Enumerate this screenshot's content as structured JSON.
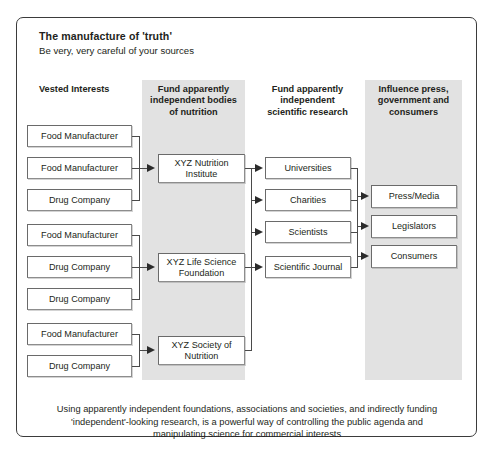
{
  "card": {
    "title": "The manufacture of 'truth'",
    "subtitle": "Be very, very careful of your sources"
  },
  "columns": [
    {
      "id": "vested-interests",
      "header": "Vested Interests",
      "shaded": false
    },
    {
      "id": "fund-bodies",
      "header": "Fund apparently independent bodies of nutrition",
      "shaded": true
    },
    {
      "id": "fund-research",
      "header": "Fund apparently independent scientific research",
      "shaded": false
    },
    {
      "id": "influence",
      "header": "Influence press, government and consumers",
      "shaded": true
    }
  ],
  "column_headers": {
    "c1": "Vested Interests",
    "c2_l1": "Fund apparently",
    "c2_l2": "independent bodies",
    "c2_l3": "of nutrition",
    "c3_l1": "Fund apparently",
    "c3_l2": "independent",
    "c3_l3": "scientific research",
    "c4_l1": "Influence press,",
    "c4_l2": "government and",
    "c4_l3": "consumers"
  },
  "vested_interests": [
    {
      "label": "Food Manufacturer",
      "group": 1
    },
    {
      "label": "Food Manufacturer",
      "group": 1
    },
    {
      "label": "Drug Company",
      "group": 1
    },
    {
      "label": "Food Manufacturer",
      "group": 2
    },
    {
      "label": "Drug Company",
      "group": 2
    },
    {
      "label": "Drug Company",
      "group": 2
    },
    {
      "label": "Food Manufacturer",
      "group": 3
    },
    {
      "label": "Drug Company",
      "group": 3
    }
  ],
  "bodies": [
    {
      "line1": "XYZ Nutrition",
      "line2": "Institute"
    },
    {
      "line1": "XYZ Life Science",
      "line2": "Foundation"
    },
    {
      "line1": "XYZ Society of",
      "line2": "Nutrition"
    }
  ],
  "research": [
    {
      "label": "Universities"
    },
    {
      "label": "Charities"
    },
    {
      "label": "Scientists"
    },
    {
      "label": "Scientific Journal"
    }
  ],
  "influence": [
    {
      "label": "Press/Media"
    },
    {
      "label": "Legislators"
    },
    {
      "label": "Consumers"
    }
  ],
  "footer": {
    "line1": "Using apparently independent foundations, associations and societies, and indirectly funding",
    "line2": "'independent'-looking research, is a powerful way of controlling the public agenda and",
    "line3": "manipulating science for commercial interests"
  },
  "colors": {
    "panel": "#e2e2e2",
    "border": "#3b3b3b",
    "box_border": "#8d8d8d",
    "arrow": "#2b2b2b",
    "text": "#231f20",
    "background": "#ffffff"
  }
}
